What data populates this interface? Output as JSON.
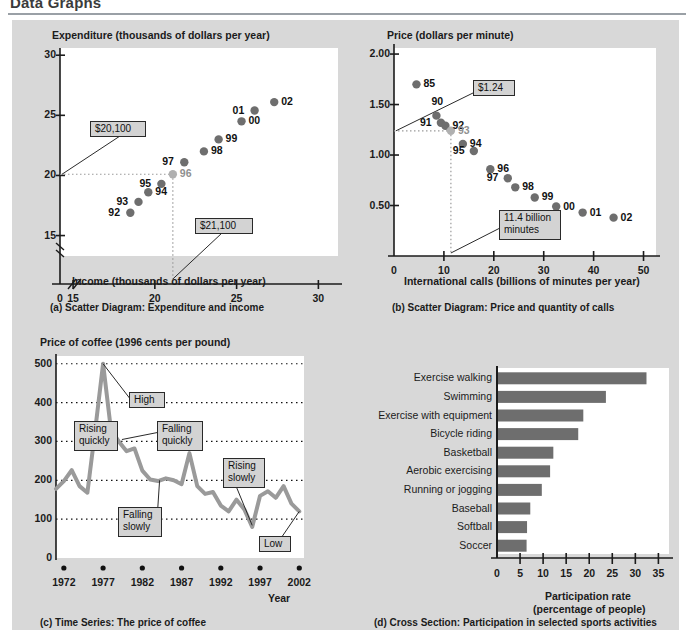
{
  "page": {
    "title": "Data Graphs"
  },
  "panels": {
    "a": {
      "caption": "(a)  Scatter Diagram: Expenditure and income",
      "y_axis_title": "Expenditure (thousands of dollars per year)",
      "x_axis_title": "Income (thousands of dollars per year)",
      "callouts": [
        {
          "text": "$20,100"
        },
        {
          "text": "$21,100"
        }
      ]
    },
    "b": {
      "caption": "(b)  Scatter Diagram: Price and quantity of calls",
      "y_axis_title": "Price (dollars per minute)",
      "x_axis_title": "International calls (billions of minutes per year)",
      "callouts": [
        {
          "text": "$1.24"
        },
        {
          "text": "11.4 billion\nminutes"
        }
      ]
    },
    "c": {
      "caption": "(c)  Time Series: The price of coffee",
      "y_axis_title": "Price of coffee (1996 cents per pound)",
      "x_axis_title": "Year",
      "callouts": [
        {
          "text": "High"
        },
        {
          "text": "Rising\nquickly"
        },
        {
          "text": "Falling\nquickly"
        },
        {
          "text": "Falling\nslowly"
        },
        {
          "text": "Rising\nslowly"
        },
        {
          "text": "Low"
        }
      ]
    },
    "d": {
      "caption": "(d)  Cross Section: Participation in selected sports activities",
      "x_axis_title_line1": "Participation rate",
      "x_axis_title_line2": "(percentage of people)"
    }
  },
  "chart_data": [
    {
      "id": "a",
      "type": "scatter",
      "title": "Scatter Diagram: Expenditure and income",
      "xlabel": "Income (thousands of dollars per year)",
      "ylabel": "Expenditure (thousands of dollars per year)",
      "xlim": [
        14,
        31
      ],
      "ylim": [
        13.5,
        30.5
      ],
      "xticks": [
        0,
        15,
        20,
        25,
        30
      ],
      "yticks": [
        15,
        20,
        25,
        30
      ],
      "axis_break": true,
      "grid": false,
      "highlight_point": "96",
      "points": [
        {
          "label": "92",
          "x": 18.5,
          "y": 16.9,
          "lab_pos": "left"
        },
        {
          "label": "93",
          "x": 19.0,
          "y": 17.8,
          "lab_pos": "left"
        },
        {
          "label": "94",
          "x": 19.6,
          "y": 18.6,
          "lab_pos": "right"
        },
        {
          "label": "95",
          "x": 20.4,
          "y": 19.3,
          "lab_pos": "left"
        },
        {
          "label": "96",
          "x": 21.1,
          "y": 20.1,
          "lab_pos": "right"
        },
        {
          "label": "97",
          "x": 21.8,
          "y": 21.1,
          "lab_pos": "left"
        },
        {
          "label": "98",
          "x": 23.0,
          "y": 22.0,
          "lab_pos": "right"
        },
        {
          "label": "99",
          "x": 23.9,
          "y": 23.0,
          "lab_pos": "right"
        },
        {
          "label": "00",
          "x": 25.3,
          "y": 24.5,
          "lab_pos": "right"
        },
        {
          "label": "01",
          "x": 26.1,
          "y": 25.4,
          "lab_pos": "left"
        },
        {
          "label": "02",
          "x": 27.3,
          "y": 26.1,
          "lab_pos": "right"
        }
      ],
      "annotations": [
        {
          "text": "$20,100",
          "value": 20.1,
          "axis": "y"
        },
        {
          "text": "$21,100",
          "value": 21.1,
          "axis": "x"
        }
      ]
    },
    {
      "id": "b",
      "type": "scatter",
      "title": "Scatter Diagram: Price and quantity of calls",
      "xlabel": "International calls (billions of minutes per year)",
      "ylabel": "Price (dollars per minute)",
      "xlim": [
        0,
        52
      ],
      "ylim": [
        0,
        2.05
      ],
      "xticks": [
        0,
        10,
        20,
        30,
        40,
        50
      ],
      "yticks": [
        0.5,
        1.0,
        1.5,
        2.0
      ],
      "grid": false,
      "highlight_point": "93",
      "points": [
        {
          "label": "85",
          "x": 4.5,
          "y": 1.7,
          "lab_pos": "right"
        },
        {
          "label": "90",
          "x": 8.5,
          "y": 1.39,
          "lab_pos": "top"
        },
        {
          "label": "91",
          "x": 9.4,
          "y": 1.32,
          "lab_pos": "left"
        },
        {
          "label": "92",
          "x": 10.3,
          "y": 1.29,
          "lab_pos": "right"
        },
        {
          "label": "93",
          "x": 11.4,
          "y": 1.24,
          "lab_pos": "right"
        },
        {
          "label": "94",
          "x": 13.8,
          "y": 1.11,
          "lab_pos": "right"
        },
        {
          "label": "95",
          "x": 16.0,
          "y": 1.04,
          "lab_pos": "left"
        },
        {
          "label": "96",
          "x": 19.3,
          "y": 0.86,
          "lab_pos": "right"
        },
        {
          "label": "97",
          "x": 22.8,
          "y": 0.77,
          "lab_pos": "left"
        },
        {
          "label": "98",
          "x": 24.3,
          "y": 0.68,
          "lab_pos": "right"
        },
        {
          "label": "99",
          "x": 28.2,
          "y": 0.58,
          "lab_pos": "right"
        },
        {
          "label": "00",
          "x": 32.5,
          "y": 0.49,
          "lab_pos": "right"
        },
        {
          "label": "01",
          "x": 37.8,
          "y": 0.43,
          "lab_pos": "right"
        },
        {
          "label": "02",
          "x": 44.0,
          "y": 0.38,
          "lab_pos": "right"
        }
      ],
      "annotations": [
        {
          "text": "$1.24",
          "value": 1.24,
          "axis": "y"
        },
        {
          "text": "11.4 billion minutes",
          "value": 11.4,
          "axis": "x"
        }
      ]
    },
    {
      "id": "c",
      "type": "line",
      "title": "Time Series: The price of coffee",
      "xlabel": "Year",
      "ylabel": "Price of coffee (1996 cents per pound)",
      "xlim": [
        1971,
        2002
      ],
      "ylim": [
        0,
        520
      ],
      "xticks": [
        1972,
        1977,
        1982,
        1987,
        1992,
        1997,
        2002
      ],
      "yticks": [
        0,
        100,
        200,
        300,
        400,
        500
      ],
      "grid": true,
      "x": [
        1971,
        1972,
        1973,
        1974,
        1975,
        1976,
        1977,
        1978,
        1979,
        1980,
        1981,
        1982,
        1983,
        1984,
        1985,
        1986,
        1987,
        1988,
        1989,
        1990,
        1991,
        1992,
        1993,
        1994,
        1995,
        1996,
        1997,
        1998,
        1999,
        2000,
        2001,
        2002
      ],
      "values": [
        178,
        198,
        226,
        185,
        168,
        330,
        500,
        330,
        300,
        275,
        282,
        225,
        202,
        198,
        205,
        200,
        190,
        270,
        185,
        165,
        170,
        135,
        120,
        150,
        125,
        80,
        160,
        172,
        155,
        185,
        140,
        120
      ],
      "annotations": [
        {
          "text": "High",
          "at_year": 1977
        },
        {
          "text": "Rising quickly",
          "at_year": 1975
        },
        {
          "text": "Falling quickly",
          "at_year": 1979
        },
        {
          "text": "Falling slowly",
          "at_year": 1984
        },
        {
          "text": "Rising slowly",
          "at_year": 1993
        },
        {
          "text": "Low",
          "at_year": 2002
        }
      ]
    },
    {
      "id": "d",
      "type": "bar",
      "orientation": "horizontal",
      "title": "Cross Section: Participation in selected sports activities",
      "xlabel": "Participation rate (percentage of people)",
      "ylabel": "",
      "xlim": [
        0,
        37
      ],
      "xticks": [
        0,
        5,
        10,
        15,
        20,
        25,
        30,
        35
      ],
      "grid": false,
      "categories": [
        "Exercise walking",
        "Swimming",
        "Exercise with equipment",
        "Bicycle riding",
        "Basketball",
        "Aerobic exercising",
        "Running or jogging",
        "Baseball",
        "Softball",
        "Soccer"
      ],
      "values": [
        32.2,
        23.4,
        18.5,
        17.4,
        12.0,
        11.3,
        9.5,
        7.0,
        6.3,
        6.2
      ]
    }
  ],
  "colors": {
    "panel_bg": "#d8d8d8",
    "plot_bg": "#ffffff",
    "marker": "#6e6e6e",
    "marker_dim": "#b0b0b0",
    "line": "#9a9a9a",
    "bar": "#6e6e6e",
    "axis": "#1b1b1b",
    "callout_bg": "#d3d3d3",
    "rule": "#9aa0a6"
  }
}
